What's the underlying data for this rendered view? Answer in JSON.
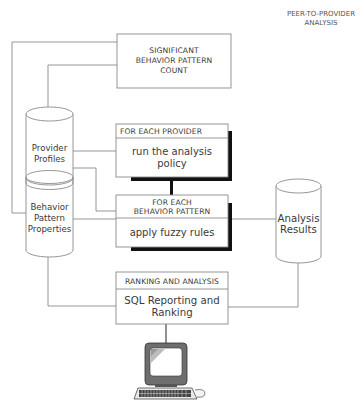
{
  "title": {
    "line1": "PEER-TO-PROVIDER",
    "line2": "ANALYSIS"
  },
  "nodes": {
    "count_box": {
      "type": "process",
      "lines": [
        "SIGNIFICANT",
        "BEHAVIOR PATTERN",
        "COUNT"
      ]
    },
    "provider_loop": {
      "type": "loop-process",
      "header": "FOR EACH PROVIDER",
      "body": [
        "run the analysis",
        "policy"
      ]
    },
    "behavior_loop": {
      "type": "loop-process",
      "header": [
        "FOR EACH",
        "BEHAVIOR PATTERN"
      ],
      "body": [
        "apply fuzzy rules"
      ]
    },
    "ranking_box": {
      "type": "process",
      "header": "RANKING AND ANALYSIS",
      "body": [
        "SQL Reporting and",
        "Ranking"
      ]
    },
    "provider_profiles": {
      "type": "database",
      "lines": [
        "Provider",
        "Profiles"
      ]
    },
    "behavior_properties": {
      "type": "database",
      "lines": [
        "Behavior",
        "Pattern",
        "Properties"
      ]
    },
    "analysis_results": {
      "type": "database",
      "lines": [
        "Analysis",
        "Results"
      ]
    },
    "terminal": {
      "type": "computer-icon"
    }
  },
  "colors": {
    "line": "#8a8a8a",
    "shadow": "#111111",
    "text": "#3a3a3a"
  }
}
